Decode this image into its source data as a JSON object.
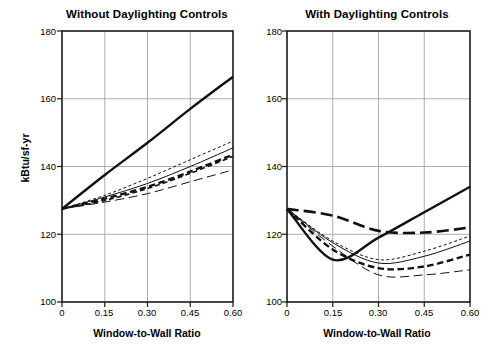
{
  "figure": {
    "ylabel": "kBtu/sf-yr",
    "xlabel": "Window-to-Wall Ratio",
    "y_ticks": [
      "180",
      "160",
      "140",
      "120",
      "100"
    ],
    "x_ticks": [
      "0",
      "0.15",
      "0.30",
      "0.45",
      "0.60"
    ]
  },
  "chart_data": [
    {
      "type": "line",
      "title": "Without Daylighting Controls",
      "xlabel": "Window-to-Wall Ratio",
      "ylabel": "kBtu/sf-yr",
      "xlim": [
        0,
        0.6
      ],
      "ylim": [
        100,
        180
      ],
      "xticks": [
        0,
        0.15,
        0.3,
        0.45,
        0.6
      ],
      "yticks": [
        100,
        120,
        140,
        160,
        180
      ],
      "grid": true,
      "legend": "none",
      "x": [
        0,
        0.15,
        0.3,
        0.45,
        0.6
      ],
      "series": [
        {
          "name": "series-1-solid-thick",
          "style": "solid-thick",
          "values": [
            127.5,
            137.5,
            147.0,
            157.0,
            166.5
          ]
        },
        {
          "name": "series-2-dotted",
          "style": "dotted-thin",
          "values": [
            127.5,
            131.5,
            136.5,
            142.0,
            147.5
          ]
        },
        {
          "name": "series-3-solid-thin",
          "style": "solid-thin",
          "values": [
            127.5,
            131.0,
            135.0,
            140.0,
            145.5
          ]
        },
        {
          "name": "series-4-dashed-thick",
          "style": "dashed-thick",
          "values": [
            127.5,
            130.5,
            134.0,
            138.5,
            143.5
          ]
        },
        {
          "name": "series-5-dashed-med",
          "style": "dashed-medium",
          "values": [
            127.5,
            130.0,
            133.5,
            138.0,
            143.0
          ]
        },
        {
          "name": "series-6-longdash",
          "style": "longdash-thin",
          "values": [
            127.5,
            129.5,
            132.0,
            135.5,
            139.0
          ]
        }
      ]
    },
    {
      "type": "line",
      "title": "With Daylighting Controls",
      "xlabel": "Window-to-Wall Ratio",
      "ylabel": "kBtu/sf-yr",
      "xlim": [
        0,
        0.6
      ],
      "ylim": [
        100,
        180
      ],
      "xticks": [
        0,
        0.15,
        0.3,
        0.45,
        0.6
      ],
      "yticks": [
        100,
        120,
        140,
        160,
        180
      ],
      "grid": true,
      "legend": "none",
      "x": [
        0,
        0.15,
        0.3,
        0.45,
        0.6
      ],
      "series": [
        {
          "name": "series-1-solid-thick",
          "style": "solid-thick",
          "values": [
            127.5,
            112.5,
            119.0,
            126.5,
            134.0
          ]
        },
        {
          "name": "series-2-longdash-thick",
          "style": "longdash-thick",
          "values": [
            127.5,
            125.5,
            121.0,
            120.5,
            122.0
          ]
        },
        {
          "name": "series-3-dotted",
          "style": "dotted-thin",
          "values": [
            127.5,
            118.0,
            112.5,
            115.0,
            119.5
          ]
        },
        {
          "name": "series-4-solid-thin",
          "style": "solid-thin",
          "values": [
            127.5,
            117.5,
            111.5,
            113.5,
            118.0
          ]
        },
        {
          "name": "series-5-dashed-thick",
          "style": "dashed-thick",
          "values": [
            127.5,
            115.5,
            110.0,
            110.5,
            114.0
          ]
        },
        {
          "name": "series-6-longdash-thin",
          "style": "longdash-thin",
          "values": [
            127.5,
            116.5,
            108.0,
            108.0,
            109.5
          ]
        }
      ]
    }
  ]
}
